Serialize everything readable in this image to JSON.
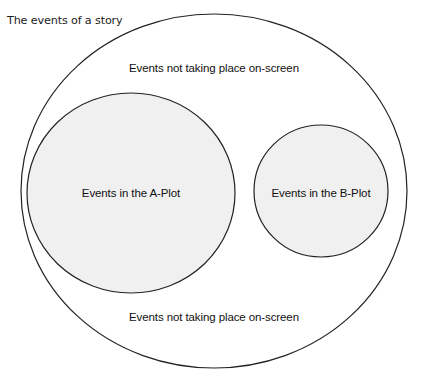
{
  "figure": {
    "caption": "The events of a story",
    "type": "venn-diagram",
    "background_color": "#ffffff"
  },
  "style": {
    "stroke_color": "#222222",
    "outer_fill": "#ffffff",
    "inner_fill": "#f0f0f0",
    "text_color": "#111111",
    "stroke_width": 1.2
  },
  "sets": {
    "outer": {
      "label": "The events of a story",
      "shape": "ellipse",
      "cx": 214,
      "cy": 191,
      "rx": 193,
      "ry": 177,
      "fill": "#ffffff"
    },
    "a_plot": {
      "label": "Events in the A-Plot",
      "shape": "ellipse",
      "cx": 131,
      "cy": 193,
      "rx": 104,
      "ry": 100,
      "fill": "#f0f0f0"
    },
    "b_plot": {
      "label": "Events in the B-Plot",
      "shape": "ellipse",
      "cx": 321,
      "cy": 191,
      "rx": 67,
      "ry": 66,
      "fill": "#f0f0f0"
    }
  },
  "region_labels": {
    "offscreen_top": "Events not taking place on-screen",
    "offscreen_bottom": "Events not taking place on-screen",
    "a_plot": "Events in the A-Plot",
    "b_plot": "Events in the B-Plot"
  }
}
